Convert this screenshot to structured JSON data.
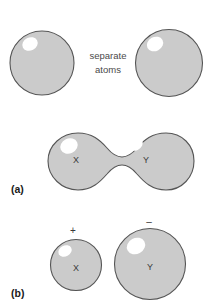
{
  "figure": {
    "background_color": "#ffffff",
    "shape_fill_color": "#cbcbcb",
    "shape_stroke_color": "#555555",
    "highlight_color": "#ffffff",
    "text_color": "#3a3a3a",
    "width": 220,
    "height": 303
  },
  "top_row": {
    "caption_line_1": "separate",
    "caption_line_2": "atoms",
    "left_atom": {
      "label": "",
      "cx": 42,
      "cy": 63,
      "r": 32,
      "highlight_cx": 30,
      "highlight_cy": 44,
      "highlight_rx": 8,
      "highlight_ry": 6.5,
      "highlight_rotate": -28
    },
    "right_atom": {
      "label": "",
      "cx": 169,
      "cy": 63,
      "r": 33.5,
      "highlight_cx": 155,
      "highlight_cy": 44,
      "highlight_rx": 8.5,
      "highlight_ry": 7,
      "highlight_rotate": -28
    },
    "caption_x": 108,
    "caption_y_1": 56,
    "caption_y_2": 70
  },
  "panel_a": {
    "label": "(a)",
    "label_x": 11,
    "label_y": 190,
    "left_atom_label": "X",
    "right_atom_label": "Y",
    "left_label_x": 76,
    "left_label_y": 161,
    "right_label_x": 146,
    "right_label_y": 161,
    "left_highlight": {
      "cx": 69,
      "cy": 146,
      "rx": 9,
      "ry": 7.5,
      "rotate": -25
    },
    "right_highlight": {
      "cx": 135,
      "cy": 144,
      "rx": 8,
      "ry": 6.5,
      "rotate": -25
    },
    "dumbbell_path": "M 78 133 C 62 133 48 145 48 161 C 48 177 62 190 78 190 C 92 190 100 182 107 174 C 112 168 116 165 122 165 C 128 165 132 168 137 174 C 144 182 152 190 166 190 C 182 190 194 177 194 161 C 194 145 182 133 166 133 C 152 133 144 140 137 148 C 132 154 128 157 122 157 C 116 157 112 154 107 148 C 100 140 92 133 78 133 Z"
  },
  "panel_b": {
    "label": "(b)",
    "label_x": 11,
    "label_y": 294,
    "cation": {
      "label": "X",
      "charge": "+",
      "cx": 76,
      "cy": 265,
      "r": 25.5,
      "label_x": 76,
      "label_y": 269,
      "charge_x": 73,
      "charge_y": 231,
      "highlight_cx": 65,
      "highlight_cy": 251,
      "highlight_rx": 7,
      "highlight_ry": 5.5,
      "highlight_rotate": -28
    },
    "anion": {
      "label": "Y",
      "charge": "–",
      "cx": 150,
      "cy": 264,
      "r": 35.5,
      "label_x": 150,
      "label_y": 268,
      "charge_x": 149,
      "charge_y": 222,
      "highlight_cx": 136,
      "highlight_cy": 246,
      "highlight_rx": 9.5,
      "highlight_ry": 8,
      "highlight_rotate": -28
    }
  }
}
